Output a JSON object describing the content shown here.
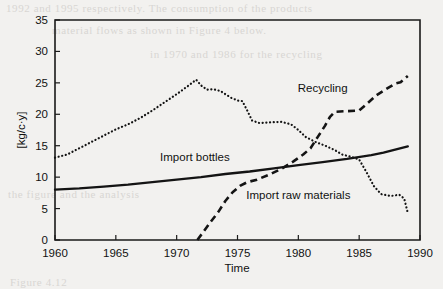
{
  "chart_data": {
    "type": "line",
    "title": "",
    "xlabel": "Time",
    "ylabel": "[kg/c·y]",
    "xlim": [
      1960,
      1990
    ],
    "ylim": [
      0,
      35
    ],
    "xticks": [
      1960,
      1965,
      1970,
      1975,
      1980,
      1985,
      1990
    ],
    "yticks": [
      0,
      5,
      10,
      15,
      20,
      25,
      30,
      35
    ],
    "grid": false,
    "legend_position": "inline-annotations",
    "series": [
      {
        "name": "Import bottles",
        "style": "solid",
        "label_x": 1971.5,
        "label_y": 12.6,
        "points": [
          [
            1960,
            8.0
          ],
          [
            1962,
            8.2
          ],
          [
            1964,
            8.5
          ],
          [
            1966,
            8.8
          ],
          [
            1968,
            9.2
          ],
          [
            1970,
            9.6
          ],
          [
            1972,
            10.0
          ],
          [
            1974,
            10.5
          ],
          [
            1976,
            10.9
          ],
          [
            1978,
            11.4
          ],
          [
            1980,
            11.9
          ],
          [
            1982,
            12.4
          ],
          [
            1984,
            12.9
          ],
          [
            1986,
            13.5
          ],
          [
            1987,
            13.9
          ],
          [
            1989,
            14.9
          ]
        ]
      },
      {
        "name": "Import raw materials",
        "style": "dotted",
        "label_x": 1980.0,
        "label_y": 6.6,
        "points": [
          [
            1960,
            13.1
          ],
          [
            1961,
            13.6
          ],
          [
            1962,
            14.6
          ],
          [
            1963,
            15.6
          ],
          [
            1964,
            16.6
          ],
          [
            1965,
            17.6
          ],
          [
            1966,
            18.4
          ],
          [
            1967,
            19.4
          ],
          [
            1968,
            20.6
          ],
          [
            1969,
            21.9
          ],
          [
            1970,
            23.2
          ],
          [
            1971,
            24.6
          ],
          [
            1971.6,
            25.5
          ],
          [
            1972,
            24.6
          ],
          [
            1972.5,
            23.9
          ],
          [
            1973,
            24.0
          ],
          [
            1973.6,
            23.7
          ],
          [
            1974,
            23.2
          ],
          [
            1974.5,
            22.6
          ],
          [
            1975,
            22.2
          ],
          [
            1975.4,
            22.1
          ],
          [
            1975.8,
            20.6
          ],
          [
            1976.2,
            19.0
          ],
          [
            1976.8,
            18.6
          ],
          [
            1977.6,
            18.7
          ],
          [
            1978.6,
            18.8
          ],
          [
            1979.4,
            18.4
          ],
          [
            1980,
            17.5
          ],
          [
            1980.6,
            16.4
          ],
          [
            1981.4,
            15.6
          ],
          [
            1982.2,
            15.0
          ],
          [
            1983,
            14.3
          ],
          [
            1983.6,
            13.6
          ],
          [
            1984.4,
            13.2
          ],
          [
            1985,
            12.8
          ],
          [
            1985.6,
            10.8
          ],
          [
            1986.2,
            8.6
          ],
          [
            1986.8,
            7.3
          ],
          [
            1987.6,
            7.0
          ],
          [
            1988.3,
            7.2
          ],
          [
            1988.7,
            6.6
          ],
          [
            1989,
            4.3
          ]
        ]
      },
      {
        "name": "Recycling",
        "style": "dashed",
        "label_x": 1982.0,
        "label_y": 23.6,
        "points": [
          [
            1971.7,
            0.0
          ],
          [
            1972.2,
            1.3
          ],
          [
            1972.8,
            2.9
          ],
          [
            1973.4,
            4.4
          ],
          [
            1974,
            6.2
          ],
          [
            1974.6,
            7.6
          ],
          [
            1975.2,
            8.6
          ],
          [
            1975.8,
            9.2
          ],
          [
            1976.6,
            9.6
          ],
          [
            1977.6,
            10.4
          ],
          [
            1978.6,
            11.3
          ],
          [
            1979.6,
            12.5
          ],
          [
            1980.4,
            13.6
          ],
          [
            1981,
            14.6
          ],
          [
            1981.6,
            16.4
          ],
          [
            1982.2,
            18.2
          ],
          [
            1982.6,
            19.6
          ],
          [
            1983,
            20.4
          ],
          [
            1984,
            20.5
          ],
          [
            1985,
            20.6
          ],
          [
            1985.6,
            21.6
          ],
          [
            1986.4,
            23.0
          ],
          [
            1987.2,
            24.0
          ],
          [
            1988,
            24.9
          ],
          [
            1988.4,
            25.1
          ],
          [
            1989,
            26.1
          ]
        ]
      }
    ]
  },
  "scan_artifacts": {
    "line_1": "1992 and 1995 respectively. The consumption of the products",
    "line_2": "material flows as shown in Figure 4 below.",
    "line_3": "in 1970 and 1986 for the recycling",
    "line_4": "the figure and the analysis",
    "line_5": "Figure 4.12"
  }
}
